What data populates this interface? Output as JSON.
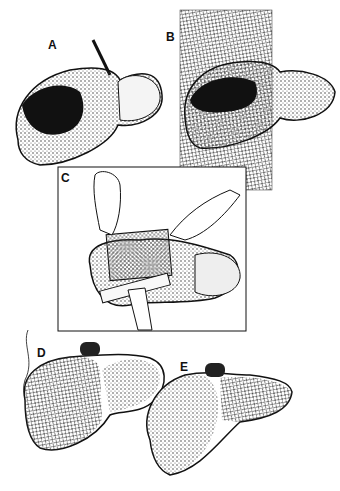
{
  "figure": {
    "panels": [
      {
        "id": "A",
        "label": "A",
        "description": "Liver with large laceration in right lobe, held by instrument"
      },
      {
        "id": "B",
        "label": "B",
        "description": "Liver laid on rectangular sheet of mesh"
      },
      {
        "id": "C",
        "label": "C",
        "description": "Hands wrapping mesh around lacerated liver lobe, ruler underneath"
      },
      {
        "id": "D",
        "label": "D",
        "description": "Right lobe wrapped in mesh, tied with suture"
      },
      {
        "id": "E",
        "label": "E",
        "description": "Left lobe wrapped in mesh"
      }
    ],
    "colors": {
      "ink": "#111111",
      "paper": "#ffffff",
      "mesh": "#555555"
    }
  }
}
